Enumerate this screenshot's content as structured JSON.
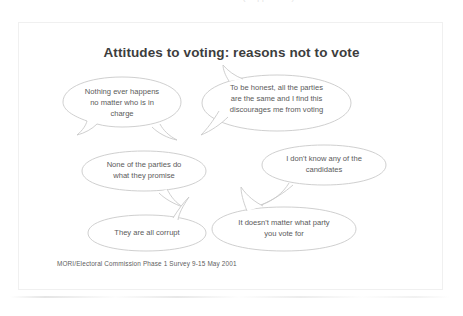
{
  "scan": {
    "top_cropped_text": "reasons not to vote (cropped line)",
    "bottom_smudge": "scan-artifact"
  },
  "slide": {
    "title": "Attitudes to voting:  reasons not to vote",
    "source": "MORI/Electoral Commission Phase 1 Survey  9-15 May 2001",
    "stroke_color": "#c9c9c9",
    "text_color": "#5a5a5a",
    "title_color": "#3d3d3d",
    "background": "#ffffff",
    "bubbles": [
      {
        "id": "nothing-ever-happens",
        "text": "Nothing ever happens\nno matter who is in\ncharge",
        "tail": "bottom-right"
      },
      {
        "id": "parties-all-the-same",
        "text": "To be honest, all the parties\nare the same and I find this\ndiscourages me from voting",
        "tail": "top-left"
      },
      {
        "id": "none-keep-promises",
        "text": "None of the parties do\nwhat they promise",
        "tail": "bottom-right"
      },
      {
        "id": "dont-know-candidates",
        "text": "I don't know any of the\ncandidates",
        "tail": "bottom-left"
      },
      {
        "id": "all-corrupt",
        "text": "They are all corrupt",
        "tail": "top-right"
      },
      {
        "id": "doesnt-matter-what-party",
        "text": "It doesn't matter what party\nyou vote for",
        "tail": "top-left"
      }
    ]
  }
}
